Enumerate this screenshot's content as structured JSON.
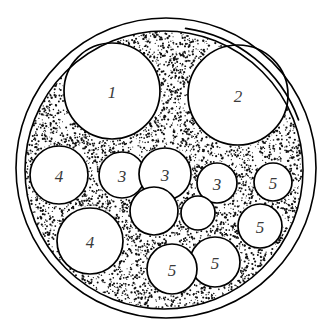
{
  "figure": {
    "background_color": "#ffffff",
    "line_color": "#000000",
    "label_color": "#3a3a3a",
    "stipple_color": "#111111"
  },
  "jacket": {
    "outer_circle": {
      "cx": 166,
      "cy": 168,
      "r": 150
    },
    "inner_circle": {
      "cx": 164,
      "cy": 170,
      "r": 139
    },
    "seam_arc": {
      "cx": 166,
      "cy": 168,
      "r": 150,
      "start_deg": -82,
      "end_deg": -20,
      "name": "jacket-seam-overlap"
    }
  },
  "filler": {
    "name": "stipple-filler",
    "boundary": {
      "cx": 164,
      "cy": 170,
      "r": 139
    },
    "dot_count": 2600,
    "seed": 20240617
  },
  "cores": [
    {
      "id": "core-1",
      "label": "1",
      "cx": 112,
      "cy": 91,
      "r": 48
    },
    {
      "id": "core-2",
      "label": "2",
      "cx": 238,
      "cy": 95,
      "r": 50
    },
    {
      "id": "core-3",
      "label": "4",
      "cx": 59,
      "cy": 175,
      "r": 29
    },
    {
      "id": "core-4",
      "label": "4",
      "cx": 90,
      "cy": 241,
      "r": 33
    },
    {
      "id": "core-5",
      "label": "3",
      "cx": 122,
      "cy": 175,
      "r": 23
    },
    {
      "id": "core-6",
      "label": "3",
      "cx": 165,
      "cy": 174,
      "r": 26
    },
    {
      "id": "core-7",
      "label": "",
      "cx": 154,
      "cy": 211,
      "r": 24
    },
    {
      "id": "core-8",
      "label": "3",
      "cx": 217,
      "cy": 183,
      "r": 20
    },
    {
      "id": "core-9",
      "label": "",
      "cx": 198,
      "cy": 213,
      "r": 17
    },
    {
      "id": "core-10",
      "label": "5",
      "cx": 273,
      "cy": 182,
      "r": 19
    },
    {
      "id": "core-11",
      "label": "5",
      "cx": 260,
      "cy": 226,
      "r": 22
    },
    {
      "id": "core-12",
      "label": "5",
      "cx": 215,
      "cy": 262,
      "r": 25
    },
    {
      "id": "core-13",
      "label": "5",
      "cx": 172,
      "cy": 269,
      "r": 25
    }
  ],
  "label_font_size": 17
}
